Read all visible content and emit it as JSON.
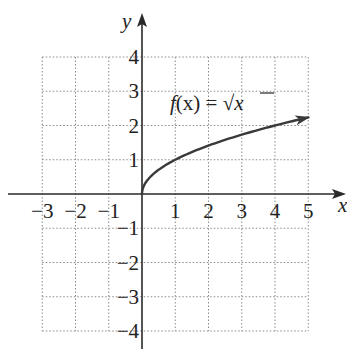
{
  "chart_data": {
    "type": "line",
    "title": "",
    "xlabel": "x",
    "ylabel": "y",
    "xlim": [
      -3,
      5
    ],
    "ylim": [
      -4,
      4
    ],
    "grid": true,
    "grid_style": "dotted",
    "x_ticks": [
      -3,
      -2,
      -1,
      1,
      2,
      3,
      4,
      5
    ],
    "y_ticks": [
      -4,
      -3,
      -2,
      -1,
      1,
      2,
      3,
      4
    ],
    "x_tick_labels": [
      "−3",
      "−2",
      "−1",
      "1",
      "2",
      "3",
      "4",
      "5"
    ],
    "y_tick_labels": [
      "−4",
      "−3",
      "−2",
      "−1",
      "1",
      "2",
      "3",
      "4"
    ],
    "series": [
      {
        "name": "f(x) = √x",
        "function": "sqrt(x)",
        "domain": [
          0,
          5
        ],
        "end_arrow": true,
        "x": [
          0,
          0.25,
          0.5,
          1,
          2,
          3,
          4,
          5
        ],
        "values": [
          0,
          0.5,
          0.707,
          1,
          1.414,
          1.732,
          2,
          2.236
        ]
      }
    ],
    "annotations": [
      {
        "text": "f(x) = √x",
        "x": 1,
        "y": 2.6
      }
    ]
  },
  "labels": {
    "x_axis": "x",
    "y_axis": "y",
    "function_f": "f",
    "function_paren": "(x) = ",
    "radical": "√",
    "radicand": "x"
  }
}
